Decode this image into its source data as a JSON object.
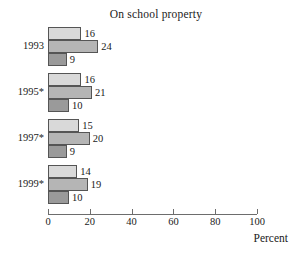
{
  "chart_data": {
    "type": "bar",
    "orientation": "horizontal",
    "title": "On school property",
    "xlabel": "Percent",
    "ylabel": "",
    "xlim": [
      0,
      100
    ],
    "xticks": [
      0,
      20,
      40,
      60,
      80,
      100
    ],
    "xtick_labels": [
      "0",
      "20",
      "40",
      "60",
      "80",
      "100"
    ],
    "grid": false,
    "legend": "none",
    "categories": [
      "1993",
      "1995*",
      "1997*",
      "1999*"
    ],
    "series": [
      {
        "name": "series-1",
        "color": "#d9d9d9",
        "values": [
          16,
          16,
          15,
          14
        ]
      },
      {
        "name": "series-2",
        "color": "#b5b5b5",
        "values": [
          24,
          21,
          20,
          19
        ]
      },
      {
        "name": "series-3",
        "color": "#9a9a9a",
        "values": [
          9,
          10,
          9,
          10
        ]
      }
    ],
    "data_labels": [
      [
        "16",
        "24",
        "9"
      ],
      [
        "16",
        "21",
        "10"
      ],
      [
        "15",
        "20",
        "9"
      ],
      [
        "14",
        "19",
        "10"
      ]
    ],
    "axis_color": "#6d6d6d",
    "bar_outline_color": "#555555"
  }
}
